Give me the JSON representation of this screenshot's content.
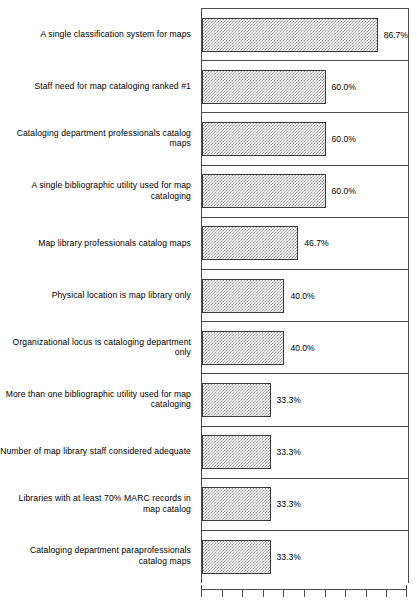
{
  "chart_data": {
    "type": "bar",
    "orientation": "horizontal",
    "title": "",
    "xlabel": "",
    "ylabel": "",
    "xlim": [
      0,
      100
    ],
    "grid": false,
    "legend": false,
    "value_suffix": "%",
    "axis_ticks": [
      0,
      10,
      20,
      30,
      40,
      50,
      60,
      70,
      80,
      90,
      100
    ],
    "axis_tick_labels_visible": false,
    "categories": [
      "A single classification system for maps",
      "Staff need for map cataloging ranked #1",
      "Cataloging department professionals catalog maps",
      "A single bibliographic utility used for map cataloging",
      "Map library professionals catalog maps",
      "Physical location is map library only",
      "Organizational locus is cataloging department only",
      "More than one bibliographic utility used for map cataloging",
      "Number of map library staff considered adequate",
      "Libraries with at least 70% MARC records in map catalog",
      "Cataloging department paraprofessionals catalog maps"
    ],
    "values": [
      86.7,
      60.0,
      60.0,
      60.0,
      46.7,
      40.0,
      40.0,
      33.3,
      33.3,
      33.3,
      33.3
    ],
    "value_labels": [
      "86.7%",
      "60.0%",
      "60.0%",
      "60.0%",
      "46.7%",
      "40.0%",
      "40.0%",
      "33.3%",
      "33.3%",
      "33.3%",
      "33.3%"
    ],
    "bar_fill": "#9a9a9a",
    "bar_edge": "#3a3a3a",
    "frame_color": "#4a4a4a",
    "background": "#ffffff"
  }
}
